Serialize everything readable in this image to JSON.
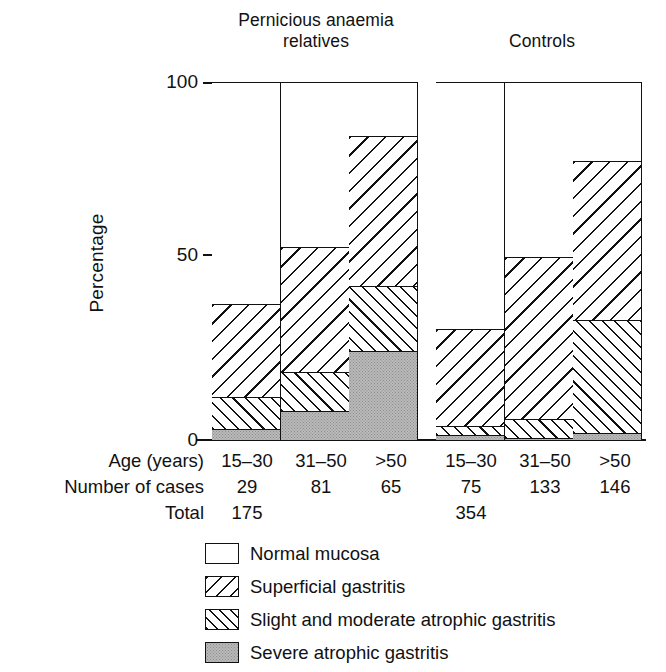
{
  "chart_data": {
    "type": "bar",
    "subtype": "stacked-bar",
    "title": "",
    "xlabel": "Age (years)",
    "ylabel": "Percentage",
    "ylim": [
      0,
      100
    ],
    "yticks": [
      0,
      50,
      100
    ],
    "grid": false,
    "legend_position": "bottom",
    "groups": [
      {
        "name": "Pernicious anaemia relatives",
        "total": 175
      },
      {
        "name": "Controls",
        "total": 354
      }
    ],
    "categories": [
      "15–30",
      "31–50",
      ">50",
      "15–30",
      "31–50",
      ">50"
    ],
    "group_of_category": [
      0,
      0,
      0,
      1,
      1,
      1
    ],
    "number_of_cases": [
      29,
      81,
      65,
      75,
      133,
      146
    ],
    "series": [
      {
        "name": "Normal mucosa",
        "values": [
          62,
          46,
          15,
          69,
          49,
          22
        ]
      },
      {
        "name": "Superficial gastritis",
        "values": [
          26,
          35,
          42,
          27,
          45,
          44.5
        ]
      },
      {
        "name": "Slight and moderate atrophic gastritis",
        "values": [
          9,
          11,
          18,
          2.5,
          5.5,
          31.5
        ]
      },
      {
        "name": "Severe atrophic gastritis",
        "values": [
          3,
          8,
          25,
          1.5,
          0.5,
          2
        ]
      }
    ],
    "cumulative_tops": {
      "severe": [
        3,
        8,
        25,
        1.5,
        0.5,
        2
      ],
      "slight": [
        12,
        19,
        43,
        4,
        6,
        33.5
      ],
      "superficial": [
        38,
        54,
        85,
        31,
        51,
        78
      ],
      "normal": [
        100,
        100,
        100,
        100,
        100,
        100
      ]
    }
  },
  "headings": {
    "group_pa": "Pernicious anaemia\nrelatives",
    "group_pa_line1": "Pernicious anaemia",
    "group_pa_line2": "relatives",
    "group_controls": "Controls"
  },
  "axis": {
    "y_title": "Percentage",
    "y_tick_100": "100",
    "y_tick_50": "50",
    "y_tick_0": "0"
  },
  "table": {
    "row_age_label": "Age (years)",
    "row_cases_label": "Number of cases",
    "row_total_label": "Total",
    "ages": [
      "15–30",
      "31–50",
      ">50",
      "15–30",
      "31–50",
      ">50"
    ],
    "cases": [
      "29",
      "81",
      "65",
      "75",
      "133",
      "146"
    ],
    "totals": [
      "175",
      "354"
    ]
  },
  "legend": {
    "items": [
      {
        "label": "Normal mucosa",
        "pattern": "blank-swatch"
      },
      {
        "label": "Superficial gastritis",
        "pattern": "backslash-hatch-swatch"
      },
      {
        "label": "Slight and moderate atrophic gastritis",
        "pattern": "forwardslash-hatch-swatch"
      },
      {
        "label": "Severe atrophic gastritis",
        "pattern": "stipple-grey-swatch"
      }
    ]
  },
  "colors": {
    "ink": "#111111",
    "paper": "#ffffff",
    "severe_fill": "#b9b9b9"
  }
}
